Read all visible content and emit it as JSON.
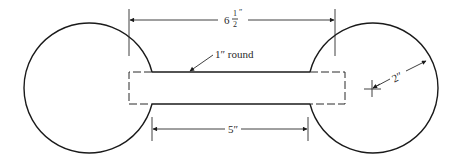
{
  "drawing": {
    "overall_dimension": {
      "whole": "6",
      "numerator": "1",
      "denominator": "2",
      "unit": "″"
    },
    "shaft_label": "1″ round",
    "shaft_length_label": "5″",
    "radius_label": "2″"
  },
  "colors": {
    "line": "#1a1a1a",
    "background": "#ffffff"
  }
}
